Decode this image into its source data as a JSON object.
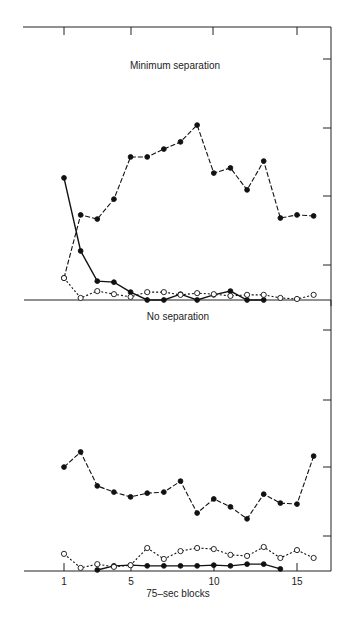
{
  "chart_data": [
    {
      "type": "line",
      "title": "Minimum separation",
      "xlabel": "75-sec blocks",
      "ylabel": "",
      "x": [
        1,
        2,
        3,
        4,
        5,
        6,
        7,
        8,
        9,
        10,
        11,
        12,
        13,
        14,
        15,
        16
      ],
      "xticks": [
        1,
        5,
        10,
        15
      ],
      "ylim": [
        0,
        8
      ],
      "yticks_unlabeled": [
        1,
        3,
        5,
        7
      ],
      "grid": false,
      "legend": null,
      "series": [
        {
          "name": "filled circles, dashed line",
          "marker": "filled",
          "line": "dashed",
          "values": [
            0.64,
            2.48,
            2.36,
            2.94,
            4.17,
            4.17,
            4.4,
            4.61,
            5.1,
            3.7,
            3.85,
            3.21,
            4.05,
            2.39,
            2.48,
            2.45
          ]
        },
        {
          "name": "filled circles, solid line",
          "marker": "filled",
          "line": "solid",
          "values": [
            3.56,
            1.43,
            0.55,
            0.52,
            0.23,
            0.0,
            0.0,
            0.17,
            0.0,
            0.15,
            0.26,
            0.0,
            0.0,
            null,
            null,
            null
          ]
        },
        {
          "name": "open circles, dotted line",
          "marker": "open",
          "line": "dotted",
          "values": [
            0.64,
            0.06,
            0.26,
            0.17,
            0.09,
            0.23,
            0.23,
            0.15,
            0.2,
            0.17,
            0.12,
            0.15,
            0.15,
            0.06,
            0.03,
            0.15
          ]
        }
      ]
    },
    {
      "type": "line",
      "title": "No separation",
      "xlabel": "75-sec blocks",
      "ylabel": "",
      "x": [
        1,
        2,
        3,
        4,
        5,
        6,
        7,
        8,
        9,
        10,
        11,
        12,
        13,
        14,
        15,
        16
      ],
      "xticks": [
        1,
        5,
        10,
        15
      ],
      "ylim": [
        0,
        8
      ],
      "yticks_unlabeled": [
        1,
        3,
        5,
        7
      ],
      "grid": false,
      "legend": null,
      "series": [
        {
          "name": "filled circles, dashed line",
          "marker": "filled",
          "line": "dashed",
          "values": [
            3.03,
            3.47,
            2.48,
            2.3,
            2.16,
            2.27,
            2.3,
            2.62,
            1.69,
            2.1,
            1.87,
            1.52,
            2.24,
            1.98,
            1.95,
            3.35
          ]
        },
        {
          "name": "filled circles, solid line",
          "marker": "filled",
          "line": "solid",
          "values": [
            null,
            null,
            0.03,
            0.15,
            0.17,
            0.15,
            0.15,
            0.15,
            0.15,
            0.17,
            0.15,
            0.2,
            0.2,
            0.06,
            null,
            null
          ]
        },
        {
          "name": "open circles, dotted line",
          "marker": "open",
          "line": "dotted",
          "values": [
            0.5,
            0.09,
            0.2,
            0.12,
            0.17,
            0.67,
            0.35,
            0.58,
            0.67,
            0.64,
            0.47,
            0.44,
            0.7,
            0.38,
            0.61,
            0.38
          ]
        }
      ]
    }
  ],
  "labels": {
    "top_title": "Minimum separation",
    "bottom_title": "No separation",
    "xlabel": "75–sec blocks",
    "xtick_labels": [
      "1",
      "5",
      "10",
      "15"
    ]
  }
}
